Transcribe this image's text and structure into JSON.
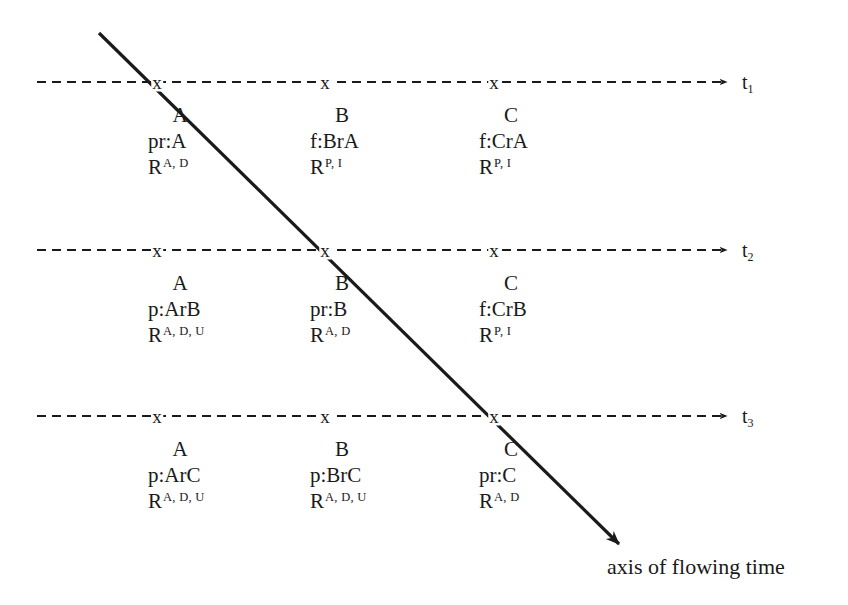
{
  "diagram": {
    "background_color": "#ffffff",
    "ink_color": "#1a1a1a",
    "timelines": [
      {
        "id": "t1",
        "label": "t",
        "subscript": "1",
        "tick_glyph": "x",
        "cells": [
          {
            "agent": "A",
            "expr": "pr:A",
            "rel_base": "R",
            "rel_sup": "A, D"
          },
          {
            "agent": "B",
            "expr": "f:BrA",
            "rel_base": "R",
            "rel_sup": "P, I"
          },
          {
            "agent": "C",
            "expr": "f:CrA",
            "rel_base": "R",
            "rel_sup": "P, I"
          }
        ]
      },
      {
        "id": "t2",
        "label": "t",
        "subscript": "2",
        "tick_glyph": "x",
        "cells": [
          {
            "agent": "A",
            "expr": "p:ArB",
            "rel_base": "R",
            "rel_sup": "A, D, U"
          },
          {
            "agent": "B",
            "expr": "pr:B",
            "rel_base": "R",
            "rel_sup": "A, D"
          },
          {
            "agent": "C",
            "expr": "f:CrB",
            "rel_base": "R",
            "rel_sup": "P, I"
          }
        ]
      },
      {
        "id": "t3",
        "label": "t",
        "subscript": "3",
        "tick_glyph": "x",
        "cells": [
          {
            "agent": "A",
            "expr": "p:ArC",
            "rel_base": "R",
            "rel_sup": "A, D, U"
          },
          {
            "agent": "B",
            "expr": "p:BrC",
            "rel_base": "R",
            "rel_sup": "A, D, U"
          },
          {
            "agent": "C",
            "expr": "pr:C",
            "rel_base": "R",
            "rel_sup": "A, D"
          }
        ]
      }
    ],
    "flow_axis": {
      "caption": "axis of flowing time"
    }
  }
}
